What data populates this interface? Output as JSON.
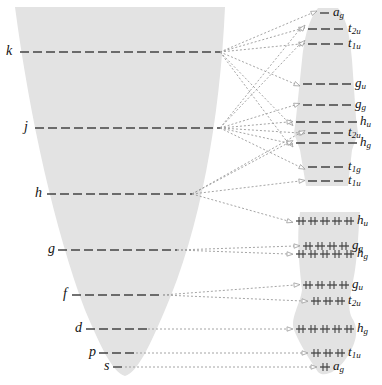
{
  "diagram": {
    "type": "orbital-correlation-diagram",
    "colors": {
      "funnel_fill": "#e3e3e3",
      "level_line": "#444444",
      "connector": "#9a9a9a",
      "text": "#111111"
    },
    "left_funnel": {
      "levels": [
        {
          "id": "k",
          "label": "k",
          "y": 52,
          "label_x": 6,
          "x1": 20,
          "x2": 220
        },
        {
          "id": "j",
          "label": "j",
          "y": 128,
          "label_x": 24,
          "x1": 35,
          "x2": 220
        },
        {
          "id": "h",
          "label": "h",
          "y": 194,
          "label_x": 35,
          "x1": 47,
          "x2": 192
        },
        {
          "id": "g",
          "label": "g",
          "y": 250,
          "label_x": 48,
          "x1": 58,
          "x2": 177
        },
        {
          "id": "f",
          "label": "f",
          "y": 295,
          "label_x": 63,
          "x1": 72,
          "x2": 163
        },
        {
          "id": "d",
          "label": "d",
          "y": 329,
          "label_x": 75,
          "x1": 86,
          "x2": 148
        },
        {
          "id": "p",
          "label": "p",
          "y": 353,
          "label_x": 89,
          "x1": 99,
          "x2": 136
        },
        {
          "id": "s",
          "label": "s",
          "y": 367,
          "label_x": 104,
          "x1": 113,
          "x2": 125
        }
      ]
    },
    "right_states": {
      "upper_group_unfilled": [
        {
          "id": "u_ag",
          "main": "a",
          "sub": "g",
          "y": 13,
          "x1": 320,
          "x2": 330
        },
        {
          "id": "u_t2u",
          "main": "t",
          "sub": "2u",
          "y": 29,
          "x1": 308,
          "x2": 345
        },
        {
          "id": "u_t1u",
          "main": "t",
          "sub": "1u",
          "y": 44,
          "x1": 308,
          "x2": 345
        },
        {
          "id": "u_gu",
          "main": "g",
          "sub": "u",
          "y": 84,
          "x1": 303,
          "x2": 352
        },
        {
          "id": "u_gg",
          "main": "g",
          "sub": "g",
          "y": 105,
          "x1": 303,
          "x2": 352
        },
        {
          "id": "u_hu",
          "main": "h",
          "sub": "u",
          "y": 122,
          "x1": 296,
          "x2": 357
        },
        {
          "id": "u_t2u_b",
          "main": "t",
          "sub": "2u",
          "y": 133,
          "x1": 308,
          "x2": 345
        },
        {
          "id": "u_hg",
          "main": "h",
          "sub": "g",
          "y": 143,
          "x1": 296,
          "x2": 357
        },
        {
          "id": "u_t1g",
          "main": "t",
          "sub": "1g",
          "y": 167,
          "x1": 308,
          "x2": 345
        },
        {
          "id": "u_t1u_b",
          "main": "t",
          "sub": "1u",
          "y": 181,
          "x1": 308,
          "x2": 345
        }
      ],
      "lower_group_filled": [
        {
          "id": "l_hu",
          "main": "h",
          "sub": "u",
          "y": 221,
          "pairs": 5,
          "x1": 296
        },
        {
          "id": "l_gg",
          "main": "g",
          "sub": "g",
          "y": 246,
          "pairs": 4,
          "x1": 303
        },
        {
          "id": "l_hg",
          "main": "h",
          "sub": "g",
          "y": 254,
          "pairs": 5,
          "x1": 296
        },
        {
          "id": "l_gu",
          "main": "g",
          "sub": "u",
          "y": 285,
          "pairs": 4,
          "x1": 303
        },
        {
          "id": "l_t2u",
          "main": "t",
          "sub": "2u",
          "y": 301,
          "pairs": 3,
          "x1": 311
        },
        {
          "id": "l_hg_b",
          "main": "h",
          "sub": "g",
          "y": 329,
          "pairs": 5,
          "x1": 296
        },
        {
          "id": "l_t1u",
          "main": "t",
          "sub": "1u",
          "y": 353,
          "pairs": 3,
          "x1": 311
        },
        {
          "id": "l_ag",
          "main": "a",
          "sub": "g",
          "y": 367,
          "pairs": 1,
          "x1": 320
        }
      ]
    },
    "connectors": [
      {
        "from": "k",
        "to": "u_ag"
      },
      {
        "from": "k",
        "to": "u_t2u"
      },
      {
        "from": "k",
        "to": "u_t1u"
      },
      {
        "from": "k",
        "to": "u_gu"
      },
      {
        "from": "k",
        "to": "u_hu"
      },
      {
        "from": "k",
        "to": "u_hg"
      },
      {
        "from": "j",
        "to": "u_t2u"
      },
      {
        "from": "j",
        "to": "u_t1u"
      },
      {
        "from": "j",
        "to": "u_gg"
      },
      {
        "from": "j",
        "to": "u_t2u_b"
      },
      {
        "from": "j",
        "to": "u_hg"
      },
      {
        "from": "j",
        "to": "u_t1g"
      },
      {
        "from": "j",
        "to": "u_hu"
      },
      {
        "from": "h",
        "to": "u_t2u_b"
      },
      {
        "from": "h",
        "to": "u_t1u_b"
      },
      {
        "from": "h",
        "to": "l_hu"
      },
      {
        "from": "h",
        "to": "u_hg"
      },
      {
        "from": "g",
        "to": "l_gg"
      },
      {
        "from": "g",
        "to": "l_hg"
      },
      {
        "from": "f",
        "to": "l_gu"
      },
      {
        "from": "f",
        "to": "l_t2u"
      },
      {
        "from": "d",
        "to": "l_hg_b"
      },
      {
        "from": "p",
        "to": "l_t1u"
      },
      {
        "from": "s",
        "to": "l_ag"
      }
    ]
  }
}
